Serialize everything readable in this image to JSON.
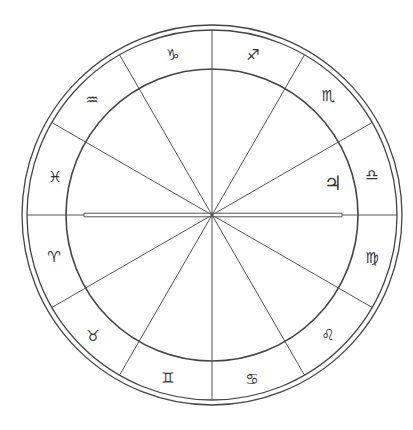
{
  "chart": {
    "center": [
      212,
      215
    ],
    "outer_radius": 190,
    "outer_radius_inner": 185,
    "inner_radius": 146,
    "line_color": "#444444",
    "signs": [
      {
        "name": "aries",
        "glyph": "♈",
        "x": 54,
        "y": 257
      },
      {
        "name": "taurus",
        "glyph": "♉",
        "x": 93,
        "y": 336
      },
      {
        "name": "gemini",
        "glyph": "♊",
        "x": 168,
        "y": 378
      },
      {
        "name": "cancer",
        "glyph": "♋",
        "x": 252,
        "y": 379
      },
      {
        "name": "leo",
        "glyph": "♌",
        "x": 328,
        "y": 335
      },
      {
        "name": "virgo",
        "glyph": "♍",
        "x": 372,
        "y": 258
      },
      {
        "name": "libra",
        "glyph": "♎",
        "x": 372,
        "y": 175
      },
      {
        "name": "scorpio",
        "glyph": "♏",
        "x": 328,
        "y": 96
      },
      {
        "name": "sagittarius",
        "glyph": "♐",
        "x": 253,
        "y": 55
      },
      {
        "name": "capricorn",
        "glyph": "♑",
        "x": 173,
        "y": 55
      },
      {
        "name": "aquarius",
        "glyph": "♒",
        "x": 92,
        "y": 100
      },
      {
        "name": "pisces",
        "glyph": "♓",
        "x": 55,
        "y": 177
      }
    ],
    "planets": [
      {
        "name": "jupiter",
        "glyph": "♃",
        "x": 333,
        "y": 183
      }
    ],
    "axis": {
      "double_line_x1": 84,
      "double_line_x2": 342
    }
  }
}
